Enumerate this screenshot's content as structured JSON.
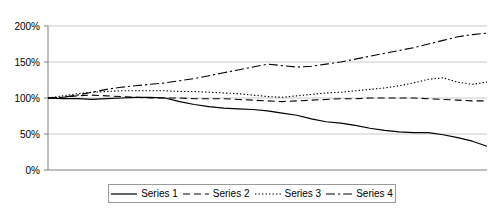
{
  "chart_data": {
    "type": "line",
    "title": "",
    "xlabel": "",
    "ylabel": "",
    "ylim": [
      0,
      200
    ],
    "yticks": [
      0,
      50,
      100,
      150,
      200
    ],
    "ytick_labels": [
      "0%",
      "50%",
      "100%",
      "150%",
      "200%"
    ],
    "grid": true,
    "grid_axis": "y",
    "legend_position": "bottom-center",
    "x": [
      0,
      1,
      2,
      3,
      4,
      5,
      6,
      7,
      8,
      9,
      10,
      11,
      12,
      13,
      14,
      15,
      16,
      17,
      18,
      19,
      20,
      21,
      22,
      23,
      24,
      25,
      26,
      27,
      28,
      29,
      30
    ],
    "xlim": [
      0,
      30
    ],
    "xtick_labels": [],
    "series": [
      {
        "name": "Series 1",
        "style": "solid",
        "color": "#000000",
        "values": [
          100,
          99,
          99,
          98,
          99,
          100,
          101,
          101,
          100,
          95,
          91,
          88,
          86,
          85,
          84,
          82,
          79,
          76,
          71,
          67,
          65,
          62,
          58,
          55,
          53,
          52,
          52,
          49,
          45,
          40,
          33
        ]
      },
      {
        "name": "Series 2",
        "style": "dashed",
        "color": "#000000",
        "values": [
          100,
          101,
          103,
          104,
          103,
          102,
          101,
          100,
          100,
          100,
          99,
          99,
          99,
          98,
          97,
          96,
          95,
          96,
          97,
          98,
          99,
          99,
          100,
          100,
          100,
          100,
          99,
          98,
          97,
          96,
          96
        ]
      },
      {
        "name": "Series 3",
        "style": "dotted",
        "color": "#000000",
        "values": [
          100,
          103,
          106,
          108,
          109,
          110,
          110,
          110,
          110,
          109,
          109,
          108,
          107,
          106,
          104,
          102,
          101,
          103,
          105,
          107,
          108,
          110,
          112,
          114,
          117,
          121,
          126,
          128,
          122,
          119,
          122
        ]
      },
      {
        "name": "Series 4",
        "style": "dashdot",
        "color": "#000000",
        "values": [
          100,
          101,
          104,
          108,
          112,
          115,
          117,
          119,
          121,
          124,
          127,
          131,
          135,
          139,
          143,
          147,
          145,
          143,
          144,
          147,
          150,
          154,
          158,
          162,
          166,
          170,
          175,
          180,
          185,
          188,
          190
        ]
      }
    ]
  },
  "legend": {
    "items": [
      {
        "label": "Series 1",
        "style": "solid"
      },
      {
        "label": "Series 2",
        "style": "dashed"
      },
      {
        "label": "Series 3",
        "style": "dotted"
      },
      {
        "label": "Series 4",
        "style": "dashdot"
      }
    ]
  },
  "colors": {
    "line": "#000000",
    "grid": "#c9c9c9",
    "axis": "#808080",
    "legend_border": "#9a9a9a",
    "background": "#ffffff"
  }
}
